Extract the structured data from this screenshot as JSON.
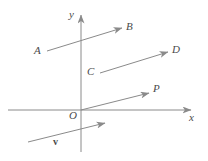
{
  "figure": {
    "background_color": "#ffffff",
    "stroke_color": "#8a8a8a",
    "label_color": "#4a4a4a",
    "width": 208,
    "height": 161
  },
  "axes": {
    "x_label": "x",
    "y_label": "y",
    "origin_label": "O",
    "x_axis": {
      "x1": 8,
      "y1": 110,
      "x2": 191,
      "y2": 110
    },
    "y_axis": {
      "x1": 81,
      "y1": 152,
      "x2": 81,
      "y2": 15
    },
    "origin": {
      "x": 81,
      "y": 110
    },
    "x_label_pos": {
      "x": 189,
      "y": 114
    },
    "y_label_pos": {
      "x": 70,
      "y": 10
    },
    "origin_label_pos": {
      "x": 70,
      "y": 112
    }
  },
  "vectors": [
    {
      "name": "vector-AB",
      "tail_label": "A",
      "head_label": "B",
      "tail": {
        "x": 47,
        "y": 51
      },
      "head": {
        "x": 122,
        "y": 28
      },
      "tail_label_pos": {
        "x": 34,
        "y": 46
      },
      "head_label_pos": {
        "x": 126,
        "y": 22
      }
    },
    {
      "name": "vector-CD",
      "tail_label": "C",
      "head_label": "D",
      "tail": {
        "x": 100,
        "y": 73
      },
      "head": {
        "x": 168,
        "y": 52
      },
      "tail_label_pos": {
        "x": 87,
        "y": 67
      },
      "head_label_pos": {
        "x": 172,
        "y": 45
      }
    },
    {
      "name": "vector-OP",
      "tail_label": "O",
      "head_label": "P",
      "tail": {
        "x": 81,
        "y": 110
      },
      "head": {
        "x": 149,
        "y": 93
      },
      "head_label_pos": {
        "x": 153,
        "y": 84
      }
    },
    {
      "name": "vector-v",
      "tail_label": "",
      "head_label": "v",
      "tail": {
        "x": 28,
        "y": 142
      },
      "head": {
        "x": 105,
        "y": 123
      },
      "head_label_pos": {
        "x": 53,
        "y": 137
      },
      "bold_label": true
    }
  ]
}
